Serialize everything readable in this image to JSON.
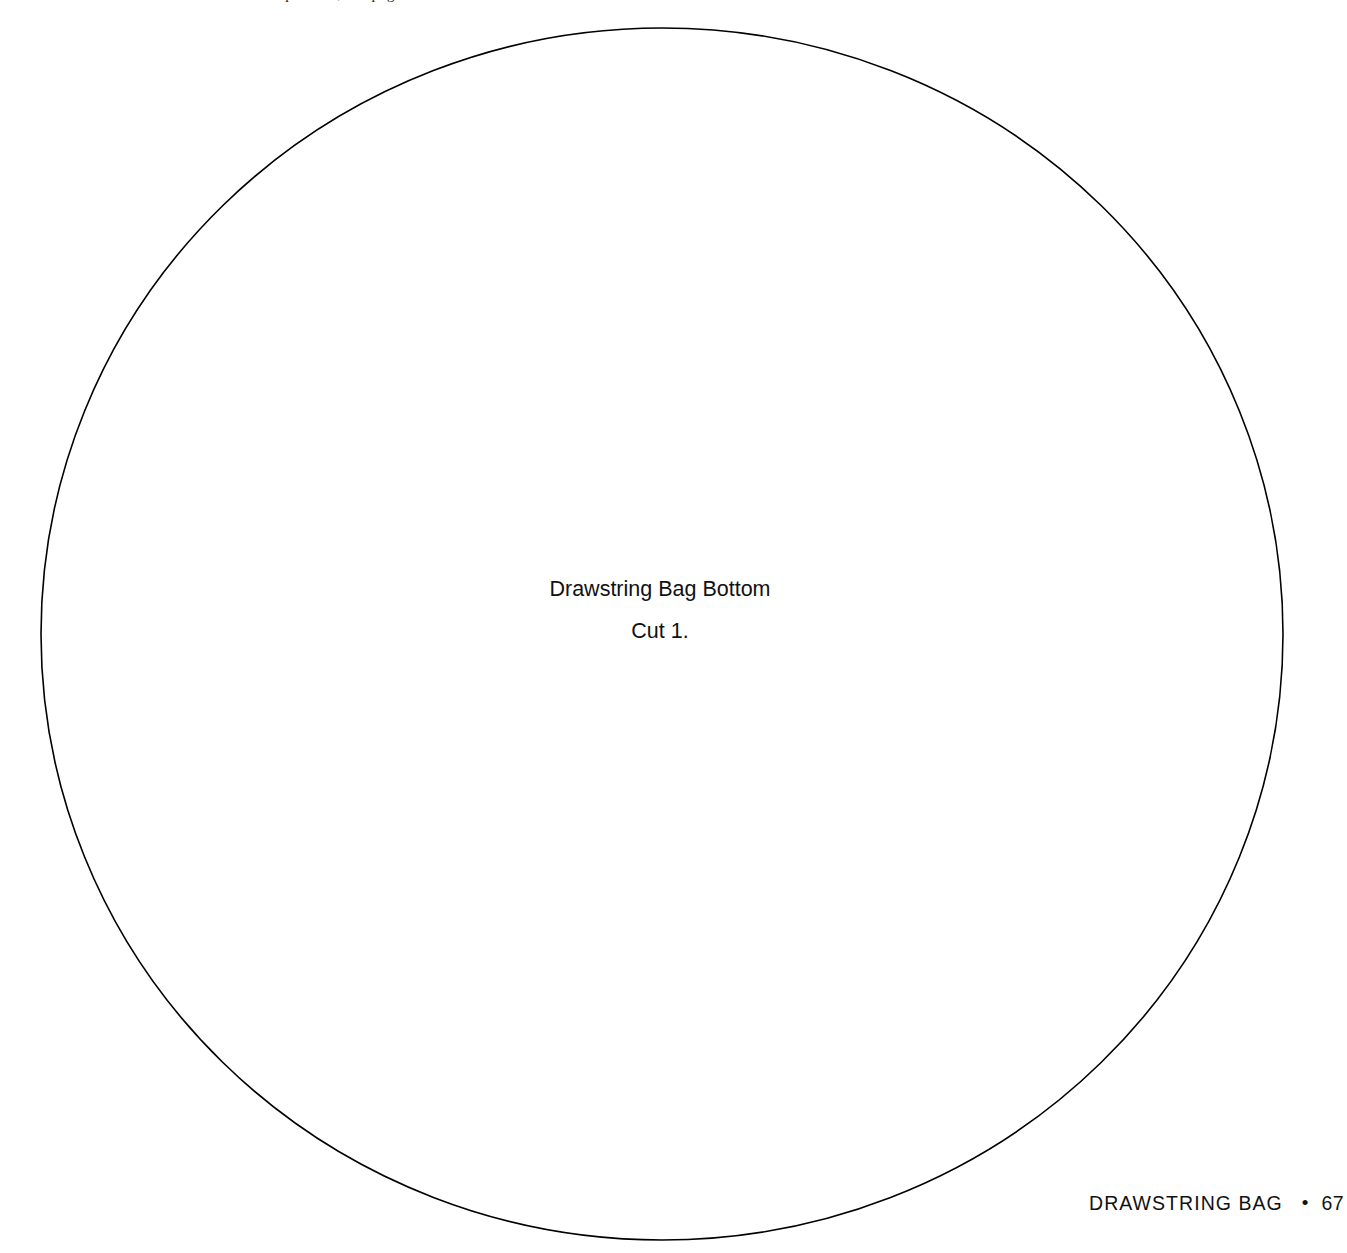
{
  "page": {
    "background_color": "#ffffff",
    "width": 1347,
    "height": 1253,
    "top_running_head_fragment": "patterns, see page 8"
  },
  "pattern": {
    "shape": "circle",
    "stroke_color": "#000000",
    "stroke_width": 1.6,
    "fill": "none",
    "center_x": 662,
    "center_y": 634,
    "radius_x": 621,
    "radius_y": 606,
    "label": {
      "line1": "Drawstring Bag Bottom",
      "line2": "Cut 1."
    }
  },
  "footer": {
    "title": "DRAWSTRING BAG",
    "separator": "•",
    "page_number": "67"
  }
}
